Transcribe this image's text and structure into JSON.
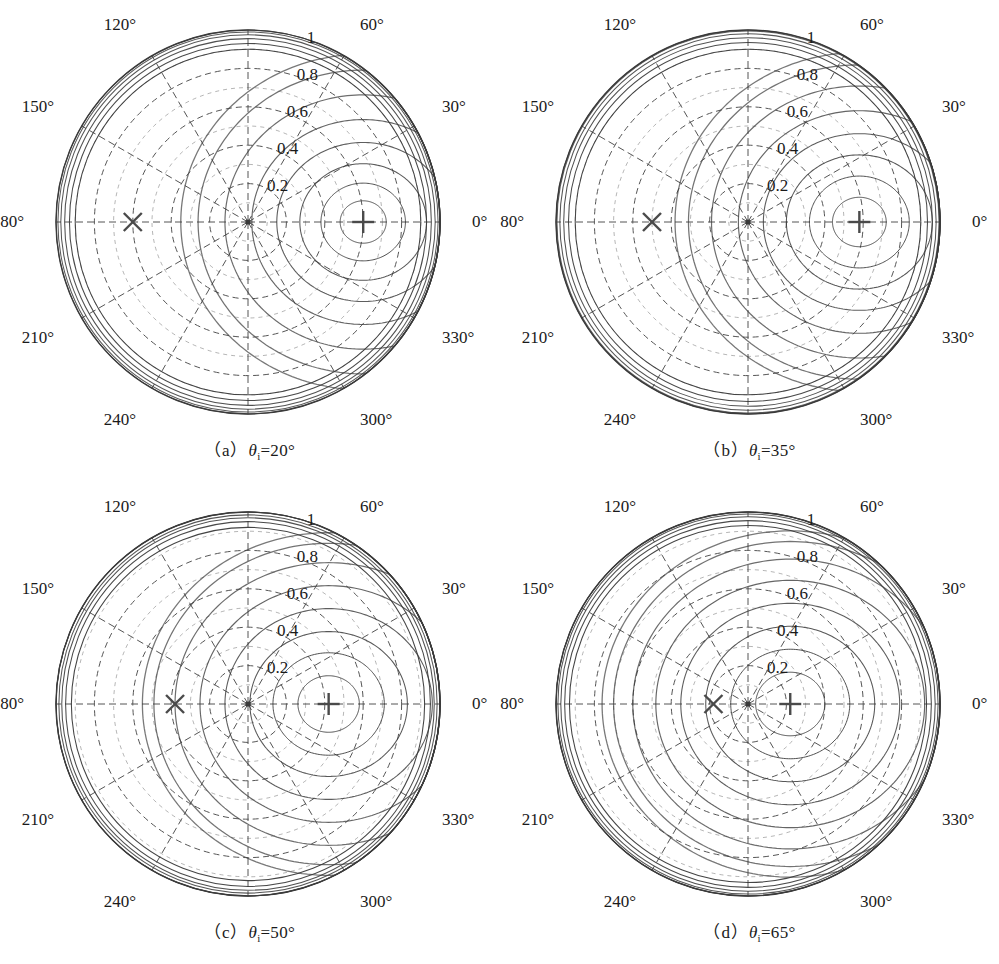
{
  "figure": {
    "type": "polar-contour-grid",
    "rows": 2,
    "cols": 2,
    "background": "#ffffff",
    "line_color": "#3a3a3a",
    "grid_color": "#555555",
    "marker_color": "#4a4a4a"
  },
  "panels": [
    {
      "id": "a",
      "caption_prefix": "（a）",
      "caption_symbol": "θ",
      "caption_sub": "i",
      "caption_value": "=20°",
      "caption_full": "（a）θi=20°",
      "theta_i_deg": 20
    },
    {
      "id": "b",
      "caption_prefix": "（b）",
      "caption_symbol": "θ",
      "caption_sub": "i",
      "caption_value": "=35°",
      "caption_full": "（b）θi=35°",
      "theta_i_deg": 35
    },
    {
      "id": "c",
      "caption_prefix": "（c）",
      "caption_symbol": "θ",
      "caption_sub": "i",
      "caption_value": "=50°",
      "caption_full": "（c）θi=50°",
      "theta_i_deg": 50
    },
    {
      "id": "d",
      "caption_prefix": "（d）",
      "caption_symbol": "θ",
      "caption_sub": "i",
      "caption_value": "=65°",
      "caption_full": "（d）θi=65°",
      "theta_i_deg": 65
    }
  ],
  "axis": {
    "angular_ticks": [
      "0°",
      "30°",
      "60°",
      "90°",
      "120°",
      "150°",
      "180°",
      "210°",
      "240°",
      "270°",
      "300°",
      "330°"
    ],
    "angular_tick_values": [
      0,
      30,
      60,
      90,
      120,
      150,
      180,
      210,
      240,
      270,
      300,
      330
    ],
    "radial_ticks": [
      "0.2",
      "0.4",
      "0.6",
      "0.8",
      "1"
    ],
    "radial_tick_values": [
      0.2,
      0.4,
      0.6,
      0.8,
      1.0
    ],
    "radial_label_angle_deg": 75,
    "rmax": 1
  },
  "markers": [
    {
      "name": "incident-direction-marker",
      "glyph": "x",
      "angle_deg": 180
    },
    {
      "name": "specular-direction-marker",
      "glyph": "plus",
      "angle_deg": 0
    }
  ],
  "chart_data": {
    "type": "contour",
    "title": "",
    "xlabel": "",
    "ylabel": "",
    "projection": "polar",
    "rlim": [
      0,
      1
    ],
    "theta_lim_deg": [
      0,
      360
    ],
    "grid": true,
    "grid_linestyle": "dashed",
    "legend": "none",
    "radial_ticks": [
      0.2,
      0.4,
      0.6,
      0.8,
      1.0
    ],
    "angular_ticks_deg": [
      0,
      30,
      60,
      90,
      120,
      150,
      180,
      210,
      240,
      270,
      300,
      330
    ],
    "contour_levels": [
      0.1,
      0.2,
      0.3,
      0.4,
      0.5,
      0.6,
      0.7,
      0.8,
      0.9,
      1.0
    ],
    "panels": [
      {
        "id": "a",
        "theta_i_deg": 20,
        "peak_r": 0.6,
        "peak_theta_deg": 0,
        "x_marker_r": 0.6,
        "x_marker_theta_deg": 180,
        "plus_marker_r": 0.6,
        "plus_marker_theta_deg": 0,
        "lobe_rings_r": [
          0.12,
          0.22,
          0.33,
          0.45,
          0.58,
          0.72,
          0.86,
          0.95
        ],
        "lobe_center_r": 0.6,
        "outer_rings_r": [
          0.9,
          0.93,
          0.955,
          0.975,
          0.99
        ],
        "description": "Narrow forward lobe concentrated near 0 degrees; strong crowding of contours on the right rim"
      },
      {
        "id": "b",
        "theta_i_deg": 35,
        "peak_r": 0.58,
        "peak_theta_deg": 0,
        "x_marker_r": 0.5,
        "x_marker_theta_deg": 180,
        "plus_marker_r": 0.58,
        "plus_marker_theta_deg": 0,
        "lobe_rings_r": [
          0.14,
          0.26,
          0.38,
          0.5,
          0.63,
          0.77,
          0.89,
          0.96
        ],
        "lobe_center_r": 0.58,
        "outer_rings_r": [
          0.9,
          0.935,
          0.96,
          0.98,
          0.995
        ],
        "description": "Broader forward lobe than panel a; contours less crowded at the rim"
      },
      {
        "id": "c",
        "theta_i_deg": 50,
        "peak_r": 0.42,
        "peak_theta_deg": 0,
        "x_marker_r": 0.38,
        "x_marker_theta_deg": 180,
        "plus_marker_r": 0.42,
        "plus_marker_theta_deg": 0,
        "lobe_rings_r": [
          0.16,
          0.29,
          0.41,
          0.54,
          0.67,
          0.8,
          0.91,
          0.97
        ],
        "lobe_center_r": 0.42,
        "outer_rings_r": [
          0.92,
          0.95,
          0.97,
          0.985,
          1.0
        ],
        "description": "Lobe shifts toward the center; contours become more circular and evenly spaced"
      },
      {
        "id": "d",
        "theta_i_deg": 65,
        "peak_r": 0.22,
        "peak_theta_deg": 0,
        "x_marker_r": 0.18,
        "x_marker_theta_deg": 180,
        "plus_marker_r": 0.22,
        "plus_marker_theta_deg": 0,
        "lobe_rings_r": [
          0.18,
          0.31,
          0.44,
          0.57,
          0.7,
          0.82,
          0.92,
          0.98
        ],
        "lobe_center_r": 0.22,
        "outer_rings_r": [
          0.93,
          0.955,
          0.975,
          0.99,
          1.0
        ],
        "description": "Nearly concentric contours centered close to the pole; both markers near the origin"
      }
    ]
  }
}
